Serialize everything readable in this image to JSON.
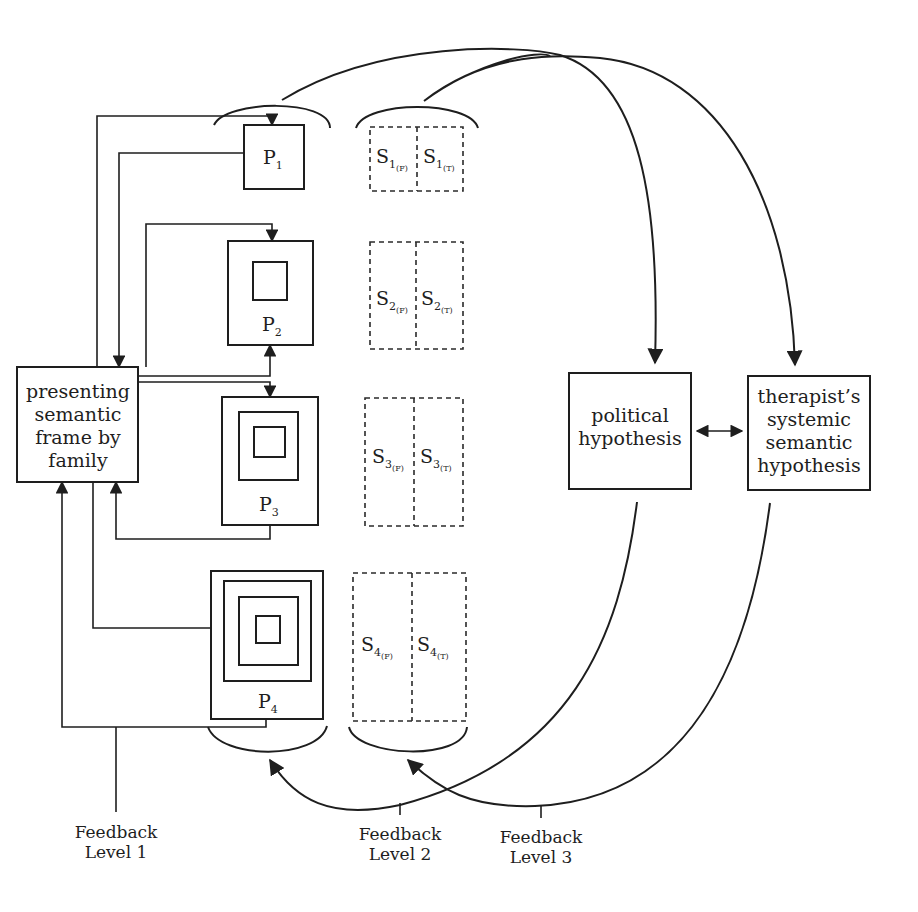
{
  "diagram": {
    "type": "feedback-loop-diagram",
    "family_frame": {
      "lines": [
        "presenting",
        "semantic",
        "frame by",
        "family"
      ]
    },
    "punctuations": [
      {
        "id": "P1",
        "base": "P",
        "index": "1",
        "nested_squares": 0
      },
      {
        "id": "P2",
        "base": "P",
        "index": "2",
        "nested_squares": 1
      },
      {
        "id": "P3",
        "base": "P",
        "index": "3",
        "nested_squares": 2
      },
      {
        "id": "P4",
        "base": "P",
        "index": "4",
        "nested_squares": 3
      }
    ],
    "semantics": [
      {
        "row": "1",
        "left": {
          "base": "S",
          "index": "1",
          "qual": "(F)"
        },
        "right": {
          "base": "S",
          "index": "1",
          "qual": "(T)"
        }
      },
      {
        "row": "2",
        "left": {
          "base": "S",
          "index": "2",
          "qual": "(F)"
        },
        "right": {
          "base": "S",
          "index": "2",
          "qual": "(T)"
        }
      },
      {
        "row": "3",
        "left": {
          "base": "S",
          "index": "3",
          "qual": "(F)"
        },
        "right": {
          "base": "S",
          "index": "3",
          "qual": "(T)"
        }
      },
      {
        "row": "4",
        "left": {
          "base": "S",
          "index": "4",
          "qual": "(F)"
        },
        "right": {
          "base": "S",
          "index": "4",
          "qual": "(T)"
        }
      }
    ],
    "political_hypothesis": {
      "lines": [
        "political",
        "hypothesis"
      ]
    },
    "therapist_hypothesis": {
      "lines": [
        "therapist’s",
        "systemic",
        "semantic",
        "hypothesis"
      ]
    },
    "feedback_levels": [
      {
        "line1": "Feedback",
        "line2": "Level 1"
      },
      {
        "line1": "Feedback",
        "line2": "Level 2"
      },
      {
        "line1": "Feedback",
        "line2": "Level 3"
      }
    ],
    "colors": {
      "stroke": "#1e1e1e",
      "background": "#ffffff"
    }
  }
}
